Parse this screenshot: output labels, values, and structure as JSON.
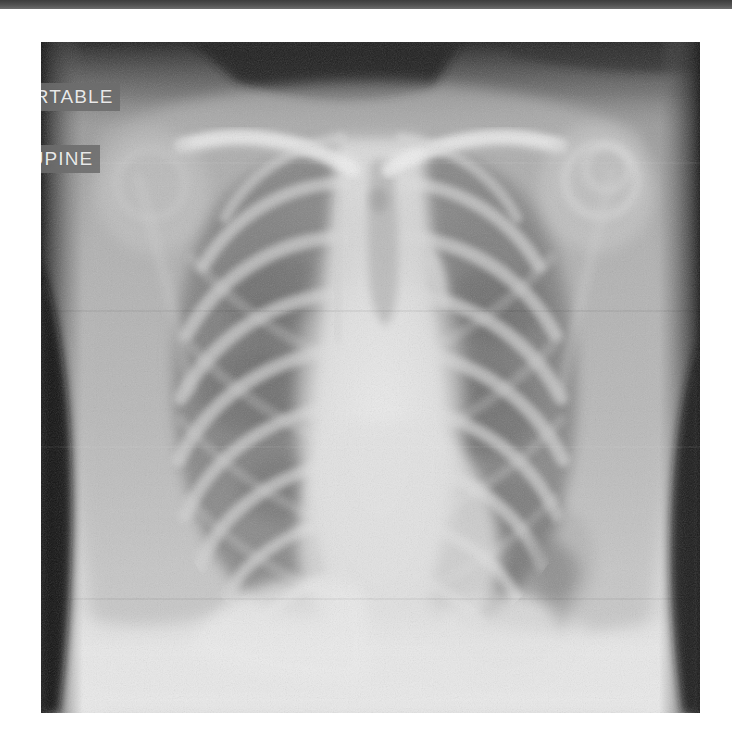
{
  "page": {
    "background_color": "#ffffff",
    "width": 732,
    "height": 750
  },
  "header": {
    "name": "top-bar",
    "color": "#4a4a4a",
    "height": 9
  },
  "radiograph": {
    "modality": "X-ray",
    "body_part": "Chest",
    "projection": "AP",
    "frame": {
      "x": 41,
      "y": 42,
      "width": 659,
      "height": 671
    },
    "annotations": [
      {
        "id": "portable",
        "text": "PORTABLE",
        "clipped_left": true,
        "visible_text": "TABLE"
      },
      {
        "id": "supine",
        "text": "SUPINE",
        "clipped_left": true,
        "visible_text": "SUPINE"
      }
    ],
    "annotation_style": {
      "text_color": "#e8e8e8",
      "box_color": "#6c6c6c"
    },
    "tones": {
      "film_base": "#9a9a9a",
      "lung_field": "#8d8d8d",
      "rib_bone": "#c6c6c6",
      "mediastinum": "#e3e3e3",
      "diaphragm": "#e8e8e8",
      "soft_tissue": "#b4b4b4",
      "air_background": "#2e2e2e"
    }
  }
}
